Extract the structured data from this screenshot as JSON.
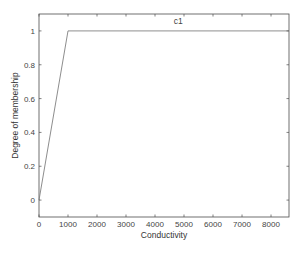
{
  "chart_data": {
    "type": "line",
    "title": "",
    "xlabel": "Conductivity",
    "ylabel": "Degree of membership",
    "xlim": [
      0,
      8620
    ],
    "ylim": [
      -0.1,
      1.1
    ],
    "xticks": [
      0,
      1000,
      2000,
      3000,
      4000,
      5000,
      6000,
      7000,
      8000
    ],
    "xtick_labels": [
      "0",
      "1000",
      "2000",
      "3000",
      "4000",
      "5000",
      "6000",
      "7000",
      "8000"
    ],
    "yticks": [
      0,
      0.2,
      0.4,
      0.6,
      0.8,
      1
    ],
    "ytick_labels": [
      "0",
      "0.2",
      "0.4",
      "0.6",
      "0.8",
      "1"
    ],
    "grid": false,
    "legend": null,
    "series": [
      {
        "name": "c1",
        "x": [
          0,
          1000,
          8620
        ],
        "y": [
          0,
          1,
          1
        ],
        "color": "#808080"
      }
    ],
    "annotations": [
      {
        "text": "c1",
        "x": 4800,
        "y": 1.05
      }
    ]
  },
  "colors": {
    "axis": "#4d4d4d",
    "line": "#808080",
    "text": "#333333"
  }
}
